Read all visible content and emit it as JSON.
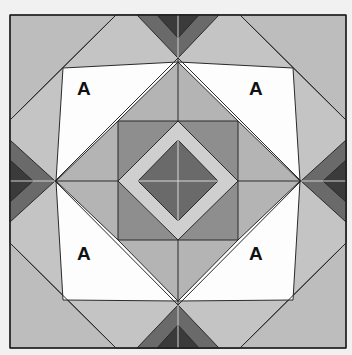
{
  "diagram": {
    "type": "quilt-block",
    "colors": {
      "background": "#f1f1f1",
      "white": "#fdfdfd",
      "light": "#bdbdbd",
      "pale": "#cfcfcf",
      "mid": "#8e8e8e",
      "dark": "#6a6a6a",
      "darkest": "#3b3b3b",
      "line": "#2a2a2a"
    },
    "labels": [
      {
        "text": "A",
        "position": "top-left"
      },
      {
        "text": "A",
        "position": "top-right"
      },
      {
        "text": "A",
        "position": "bottom-left"
      },
      {
        "text": "A",
        "position": "bottom-right"
      }
    ]
  }
}
